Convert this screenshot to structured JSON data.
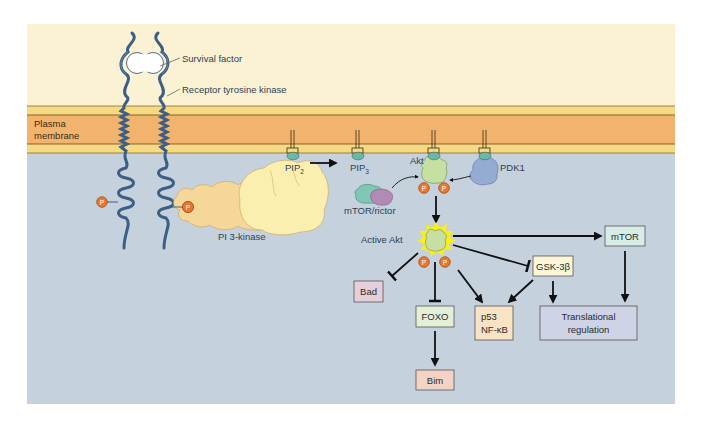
{
  "figure": {
    "colors": {
      "extracellular": "#fbf2d3",
      "membrane_outer": "#f6d983",
      "membrane_core": "#f2b46d",
      "cytoplasm": "#c5d1dc",
      "receptor": "#3c5f86",
      "phosphate": "#e9782d",
      "akt": "#c6dfa3",
      "pdk1": "#95acd2",
      "mtor_rictor_a": "#7fc7b3",
      "mtor_rictor_b": "#b28ab4",
      "pi3k_light": "#fbefb0",
      "pi3k_dark": "#f5d79a",
      "glow": "#fff200",
      "arrow": "#111111"
    }
  },
  "labels": {
    "survival_factor": "Survival factor",
    "receptor": "Receptor tyrosine kinase",
    "membrane_line1": "Plasma",
    "membrane_line2": "membrane",
    "pi3k": "PI 3-kinase",
    "pip2_base": "PIP",
    "pip2_sub": "2",
    "pip3_base": "PIP",
    "pip3_sub": "3",
    "akt": "Akt",
    "pdk1": "PDK1",
    "mtor_rictor": "mTOR/rictor",
    "active_akt": "Active Akt",
    "phosphate": "P"
  },
  "boxes": {
    "bad": {
      "label": "Bad",
      "fill": "#e6cfd9"
    },
    "foxo": {
      "label": "FOXO",
      "fill": "#e3efd6"
    },
    "bim": {
      "label": "Bim",
      "fill": "#f3d4c4"
    },
    "p53": {
      "line1": "p53",
      "line2": "NF-κB",
      "fill": "#f8e3c4"
    },
    "gsk3b": {
      "label": "GSK-3β",
      "fill": "#fbf6d6"
    },
    "mtor": {
      "label": "mTOR",
      "fill": "#d6ece4"
    },
    "translational": {
      "line1": "Translational",
      "line2": "regulation",
      "fill": "#cfd3e6"
    }
  },
  "edges": [
    {
      "from": "PIP2",
      "to": "PIP3",
      "type": "activate"
    },
    {
      "from": "mTOR/rictor",
      "to": "Akt",
      "type": "activate"
    },
    {
      "from": "PDK1",
      "to": "Akt",
      "type": "activate"
    },
    {
      "from": "Akt",
      "to": "Active Akt",
      "type": "activate"
    },
    {
      "from": "Active Akt",
      "to": "mTOR",
      "type": "activate"
    },
    {
      "from": "Active Akt",
      "to": "Bad",
      "type": "inhibit"
    },
    {
      "from": "Active Akt",
      "to": "FOXO",
      "type": "inhibit"
    },
    {
      "from": "Active Akt",
      "to": "p53 / NF-κB",
      "type": "activate"
    },
    {
      "from": "Active Akt",
      "to": "GSK-3β",
      "type": "inhibit"
    },
    {
      "from": "GSK-3β",
      "to": "p53 / NF-κB",
      "type": "activate"
    },
    {
      "from": "GSK-3β",
      "to": "Translational regulation",
      "type": "activate"
    },
    {
      "from": "mTOR",
      "to": "Translational regulation",
      "type": "activate"
    },
    {
      "from": "FOXO",
      "to": "Bim",
      "type": "activate"
    }
  ]
}
